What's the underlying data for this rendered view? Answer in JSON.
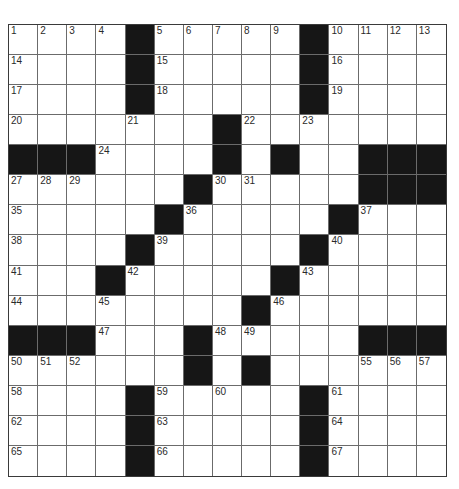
{
  "puzzle": {
    "rows": 15,
    "cols": 15,
    "colors": {
      "block": "#161616",
      "cell": "#ffffff",
      "line": "#6b6b6b"
    },
    "layout": [
      "....#.....#....",
      "....#.....#....",
      "....#.....#....",
      ".......#.......",
      "###....#.#..###",
      "......#.....###",
      ".....#.....#...",
      "....#.....#....",
      "...#.....#.....",
      "........#......",
      "###...#.....###",
      "......#.#......",
      "....#.....#....",
      "....#.....#....",
      "....#.....#...."
    ],
    "numbers": [
      {
        "r": 0,
        "c": 0,
        "n": "1"
      },
      {
        "r": 0,
        "c": 1,
        "n": "2"
      },
      {
        "r": 0,
        "c": 2,
        "n": "3"
      },
      {
        "r": 0,
        "c": 3,
        "n": "4"
      },
      {
        "r": 0,
        "c": 5,
        "n": "5"
      },
      {
        "r": 0,
        "c": 6,
        "n": "6"
      },
      {
        "r": 0,
        "c": 7,
        "n": "7"
      },
      {
        "r": 0,
        "c": 8,
        "n": "8"
      },
      {
        "r": 0,
        "c": 9,
        "n": "9"
      },
      {
        "r": 0,
        "c": 11,
        "n": "10"
      },
      {
        "r": 0,
        "c": 12,
        "n": "11"
      },
      {
        "r": 0,
        "c": 13,
        "n": "12"
      },
      {
        "r": 0,
        "c": 14,
        "n": "13"
      },
      {
        "r": 1,
        "c": 0,
        "n": "14"
      },
      {
        "r": 1,
        "c": 5,
        "n": "15"
      },
      {
        "r": 1,
        "c": 11,
        "n": "16"
      },
      {
        "r": 2,
        "c": 0,
        "n": "17"
      },
      {
        "r": 2,
        "c": 5,
        "n": "18"
      },
      {
        "r": 2,
        "c": 11,
        "n": "19"
      },
      {
        "r": 3,
        "c": 0,
        "n": "20"
      },
      {
        "r": 3,
        "c": 4,
        "n": "21"
      },
      {
        "r": 3,
        "c": 8,
        "n": "22"
      },
      {
        "r": 3,
        "c": 10,
        "n": "23"
      },
      {
        "r": 4,
        "c": 3,
        "n": "24"
      },
      {
        "r": 4,
        "c": 7,
        "n": "25"
      },
      {
        "r": 4,
        "c": 9,
        "n": "26"
      },
      {
        "r": 5,
        "c": 0,
        "n": "27"
      },
      {
        "r": 5,
        "c": 1,
        "n": "28"
      },
      {
        "r": 5,
        "c": 2,
        "n": "29"
      },
      {
        "r": 5,
        "c": 7,
        "n": "30"
      },
      {
        "r": 5,
        "c": 8,
        "n": "31"
      },
      {
        "r": 5,
        "c": 12,
        "n": "32"
      },
      {
        "r": 5,
        "c": 13,
        "n": "33"
      },
      {
        "r": 5,
        "c": 14,
        "n": "34"
      },
      {
        "r": 6,
        "c": 0,
        "n": "35"
      },
      {
        "r": 6,
        "c": 6,
        "n": "36"
      },
      {
        "r": 6,
        "c": 12,
        "n": "37"
      },
      {
        "r": 7,
        "c": 0,
        "n": "38"
      },
      {
        "r": 7,
        "c": 5,
        "n": "39"
      },
      {
        "r": 7,
        "c": 11,
        "n": "40"
      },
      {
        "r": 8,
        "c": 0,
        "n": "41"
      },
      {
        "r": 8,
        "c": 4,
        "n": "42"
      },
      {
        "r": 8,
        "c": 10,
        "n": "43"
      },
      {
        "r": 9,
        "c": 0,
        "n": "44"
      },
      {
        "r": 9,
        "c": 3,
        "n": "45"
      },
      {
        "r": 9,
        "c": 9,
        "n": "46"
      },
      {
        "r": 10,
        "c": 3,
        "n": "47"
      },
      {
        "r": 10,
        "c": 7,
        "n": "48"
      },
      {
        "r": 10,
        "c": 8,
        "n": "49"
      },
      {
        "r": 11,
        "c": 0,
        "n": "50"
      },
      {
        "r": 11,
        "c": 1,
        "n": "51"
      },
      {
        "r": 11,
        "c": 2,
        "n": "52"
      },
      {
        "r": 11,
        "c": 6,
        "n": "53"
      },
      {
        "r": 11,
        "c": 8,
        "n": "54"
      },
      {
        "r": 11,
        "c": 12,
        "n": "55"
      },
      {
        "r": 11,
        "c": 13,
        "n": "56"
      },
      {
        "r": 11,
        "c": 14,
        "n": "57"
      },
      {
        "r": 12,
        "c": 0,
        "n": "58"
      },
      {
        "r": 12,
        "c": 5,
        "n": "59"
      },
      {
        "r": 12,
        "c": 7,
        "n": "60"
      },
      {
        "r": 12,
        "c": 11,
        "n": "61"
      },
      {
        "r": 13,
        "c": 0,
        "n": "62"
      },
      {
        "r": 13,
        "c": 5,
        "n": "63"
      },
      {
        "r": 13,
        "c": 11,
        "n": "64"
      },
      {
        "r": 14,
        "c": 0,
        "n": "65"
      },
      {
        "r": 14,
        "c": 5,
        "n": "66"
      },
      {
        "r": 14,
        "c": 11,
        "n": "67"
      }
    ]
  }
}
